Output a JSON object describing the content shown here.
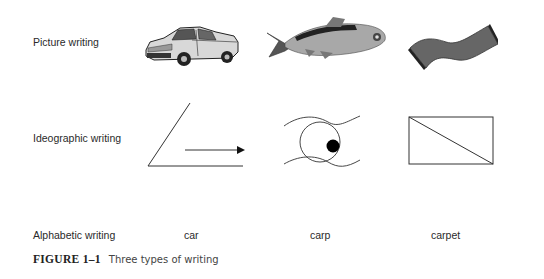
{
  "rows": [
    {
      "label": "Picture writing",
      "items": [
        "car-image",
        "carp-image",
        "carpet-image"
      ]
    },
    {
      "label": "Ideographic writing",
      "items": [
        "car-ideogram",
        "carp-ideogram",
        "carpet-ideogram"
      ]
    },
    {
      "label": "Alphabetic writing",
      "items": [
        "car",
        "carp",
        "carpet"
      ]
    }
  ],
  "caption": {
    "number": "FIGURE 1–1",
    "text": "Three types of writing"
  }
}
